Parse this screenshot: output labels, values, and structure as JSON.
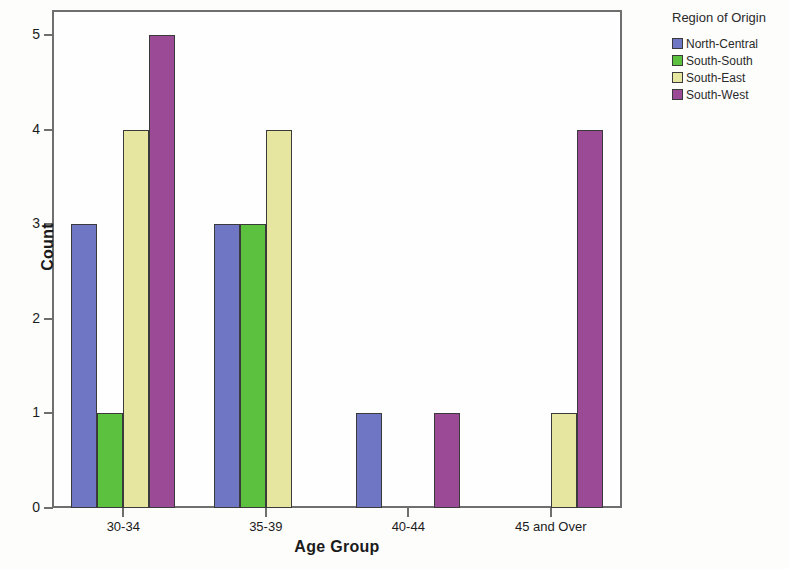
{
  "chart_data": {
    "type": "bar",
    "title": "",
    "xlabel": "Age Group",
    "ylabel": "Count",
    "categories": [
      "30-34",
      "35-39",
      "40-44",
      "45 and Over"
    ],
    "series": [
      {
        "name": "North-Central",
        "color": "#6f77c4",
        "values": [
          3,
          3,
          1,
          0
        ]
      },
      {
        "name": "South-South",
        "color": "#5cc13f",
        "values": [
          1,
          3,
          0,
          0
        ]
      },
      {
        "name": "South-East",
        "color": "#e6e6a0",
        "values": [
          4,
          4,
          0,
          1
        ]
      },
      {
        "name": "South-West",
        "color": "#9b4a96",
        "values": [
          5,
          0,
          1,
          4
        ]
      }
    ],
    "ylim": [
      0,
      5
    ],
    "yticks": [
      0,
      1,
      2,
      3,
      4,
      5
    ],
    "ytick_labels": [
      "0",
      "1",
      "2",
      "3",
      "4",
      "5"
    ],
    "grid": false,
    "legend": {
      "title": "Region of Origin",
      "position": "right"
    }
  }
}
